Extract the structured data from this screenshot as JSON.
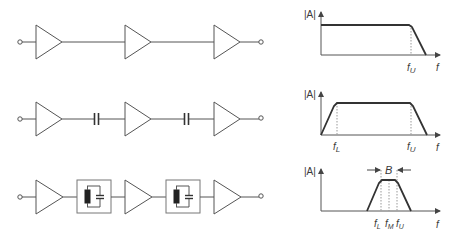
{
  "colors": {
    "line": "#555555",
    "curve": "#333333",
    "dotted": "#999999",
    "inductor_fill": "#222222"
  },
  "rows": [
    {
      "name": "direct-coupled-amplifier-chain",
      "coupling": "direct",
      "stages": 3,
      "graph": {
        "type": "lowpass",
        "y_label": "|A|",
        "x_label": "f",
        "markers": [
          {
            "main": "f",
            "sub": "U"
          }
        ]
      }
    },
    {
      "name": "capacitor-coupled-amplifier-chain",
      "coupling": "capacitor",
      "stages": 3,
      "graph": {
        "type": "bandpass-wide",
        "y_label": "|A|",
        "x_label": "f",
        "markers": [
          {
            "main": "f",
            "sub": "L"
          },
          {
            "main": "f",
            "sub": "U"
          }
        ]
      }
    },
    {
      "name": "resonant-circuit-coupled-amplifier-chain",
      "coupling": "LC-tank",
      "stages": 3,
      "graph": {
        "type": "bandpass-narrow",
        "y_label": "|A|",
        "x_label": "f",
        "bandwidth_label": "B",
        "markers": [
          {
            "main": "f",
            "sub": "L"
          },
          {
            "main": "f",
            "sub": "M"
          },
          {
            "main": "f",
            "sub": "U"
          }
        ]
      }
    }
  ]
}
